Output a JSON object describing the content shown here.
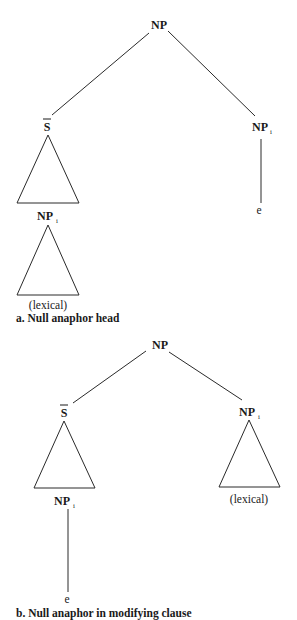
{
  "figure": {
    "panels": [
      {
        "id": "a",
        "caption": "a. Null anaphor head",
        "root": {
          "label": "NP"
        },
        "left_child": {
          "label": "S",
          "overbar": true,
          "expansion": "triangle",
          "embedded": {
            "label": "NP",
            "subscript": "i",
            "expansion": "triangle",
            "leaf": "(lexical)"
          }
        },
        "right_child": {
          "label": "NP",
          "subscript": "i",
          "expansion": "line",
          "leaf": "e"
        }
      },
      {
        "id": "b",
        "caption": "b. Null anaphor in modifying clause",
        "root": {
          "label": "NP"
        },
        "left_child": {
          "label": "S",
          "overbar": true,
          "expansion": "triangle",
          "embedded": {
            "label": "NP",
            "subscript": "i",
            "expansion": "line",
            "leaf": "e"
          }
        },
        "right_child": {
          "label": "NP",
          "subscript": "i",
          "expansion": "triangle",
          "leaf": "(lexical)"
        }
      }
    ]
  }
}
